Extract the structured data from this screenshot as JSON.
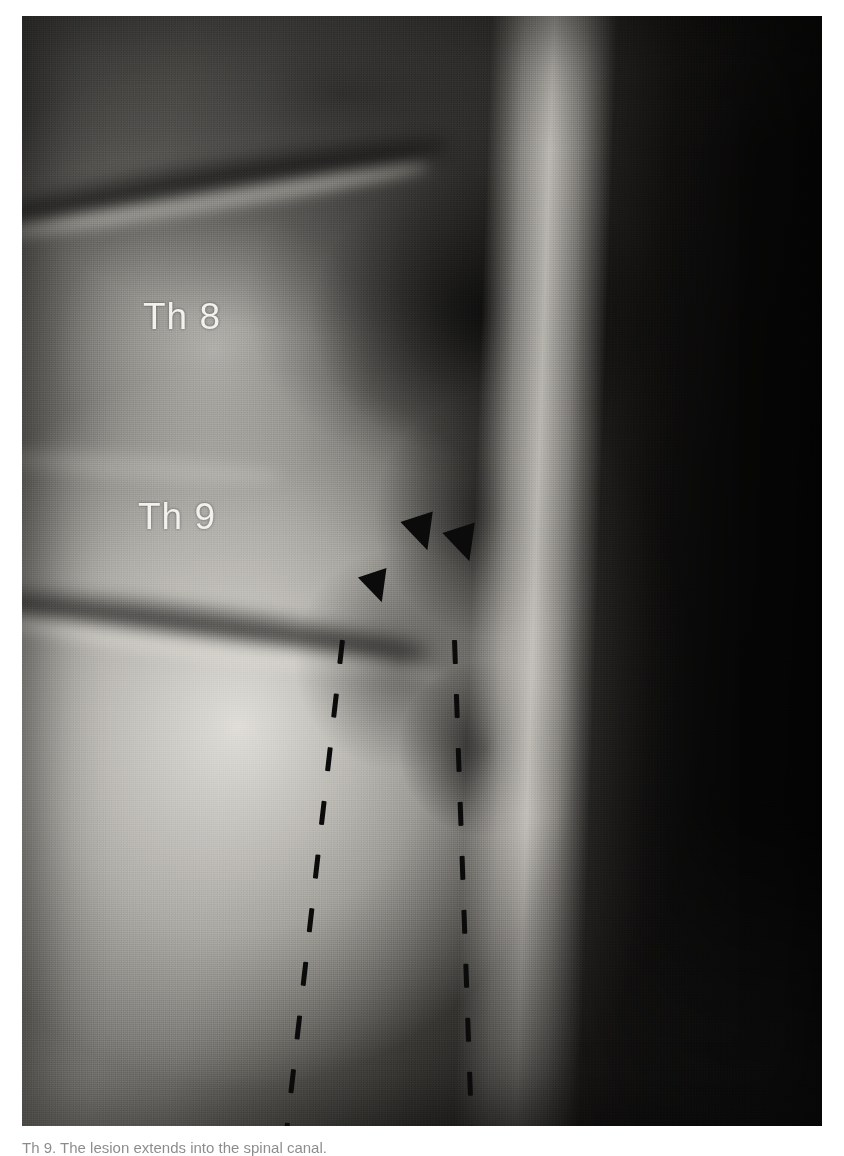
{
  "image": {
    "modality": "radiograph",
    "view": "lateral thoracic spine",
    "plate_background_hex": "#2a2a2a",
    "page_background_hex": "#ffffff",
    "annotation_text_hex": "#f2f1ee",
    "marker_hex": "#0b0b0b"
  },
  "labels": {
    "vertebra_upper": "Th 8",
    "vertebra_lower": "Th 9"
  },
  "markers": {
    "arrowheads": [
      {
        "id": "arrowhead-1",
        "x": 405,
        "y": 516,
        "size": 17,
        "rotate": -18
      },
      {
        "id": "arrowhead-2",
        "x": 447,
        "y": 527,
        "size": 17,
        "rotate": -18
      },
      {
        "id": "arrowhead-3",
        "x": 362,
        "y": 572,
        "size": 15,
        "rotate": -18
      }
    ],
    "dashed_lines": [
      {
        "id": "dashed-line-left",
        "x": 340,
        "y": 640,
        "length": 516,
        "rotate": 6.5
      },
      {
        "id": "dashed-line-right",
        "x": 452,
        "y": 640,
        "length": 516,
        "rotate": -2.0
      }
    ]
  },
  "caption": {
    "text": "Th 9. The lesion extends into the spinal canal."
  }
}
